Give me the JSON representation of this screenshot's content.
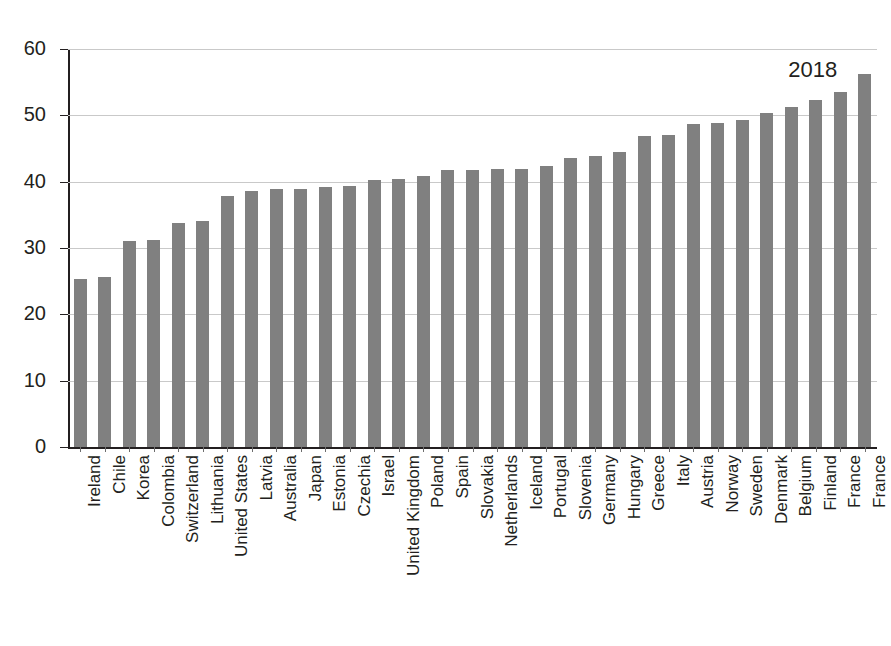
{
  "chart_data": {
    "type": "bar",
    "title": "",
    "subtitle": "",
    "xlabel": "",
    "ylabel": "",
    "ylim": [
      0,
      60
    ],
    "yticks": [
      0,
      10,
      20,
      30,
      40,
      50,
      60
    ],
    "ytick_labels": [
      "0",
      "10",
      "20",
      "30",
      "40",
      "50",
      "60"
    ],
    "grid": true,
    "legend": false,
    "legend_position": "none",
    "bar_color": "#808080",
    "axis_color": "#231f20",
    "gridline_color": "#c9c9c9",
    "annotations": [
      {
        "text": "2018",
        "x_category": "France",
        "y_value": 58.5
      }
    ],
    "categories": [
      "Ireland",
      "Chile",
      "Korea",
      "Colombia",
      "Switzerland",
      "Lithuania",
      "United States",
      "Latvia",
      "Australia",
      "Japan",
      "Estonia",
      "Czechia",
      "Israel",
      "United Kingdom",
      "Poland",
      "Spain",
      "Slovakia",
      "Netherlands",
      "Iceland",
      "Portugal",
      "Slovenia",
      "Germany",
      "Hungary",
      "Greece",
      "Italy",
      "Austria",
      "Norway",
      "Sweden",
      "Denmark",
      "Belgium",
      "Finland",
      "France"
    ],
    "values": [
      25.4,
      25.6,
      31.1,
      31.2,
      33.8,
      34.1,
      37.8,
      38.6,
      38.9,
      38.9,
      39.2,
      39.3,
      40.2,
      40.4,
      40.9,
      41.7,
      41.8,
      41.9,
      41.9,
      42.3,
      43.6,
      43.9,
      44.4,
      46.9,
      47.1,
      48.7,
      48.9,
      49.3,
      50.3,
      51.2,
      52.3,
      53.5
    ]
  },
  "extra_bars": {
    "note": "two further bars at right beyond the main list",
    "categories": [
      "France"
    ],
    "values": [
      56.2
    ]
  }
}
